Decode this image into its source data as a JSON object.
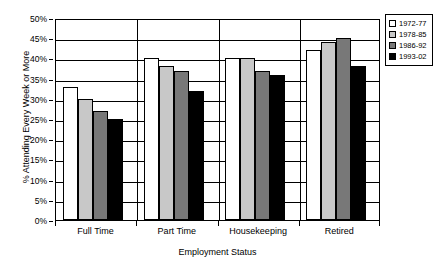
{
  "chart_data": {
    "type": "bar",
    "title": "",
    "xlabel": "Employment Status",
    "ylabel": "% Attending Every Week or More",
    "categories": [
      "Full Time",
      "Part Time",
      "Housekeeping",
      "Retired"
    ],
    "ylim": [
      0,
      50
    ],
    "ytick_labels": [
      "0%",
      "5%",
      "10%",
      "15%",
      "20%",
      "25%",
      "30%",
      "35%",
      "40%",
      "45%",
      "50%"
    ],
    "ytick_values": [
      0,
      5,
      10,
      15,
      20,
      25,
      30,
      35,
      40,
      45,
      50
    ],
    "grid": true,
    "legend_position": "right",
    "series": [
      {
        "name": "1972-77",
        "color": "#ffffff",
        "values": [
          33,
          40,
          40,
          42
        ]
      },
      {
        "name": "1978-85",
        "color": "#c8c8c8",
        "values": [
          30,
          38,
          40,
          44
        ]
      },
      {
        "name": "1986-92",
        "color": "#787878",
        "values": [
          27,
          37,
          37,
          45
        ]
      },
      {
        "name": "1993-02",
        "color": "#000000",
        "values": [
          25,
          32,
          36,
          38
        ]
      }
    ]
  }
}
